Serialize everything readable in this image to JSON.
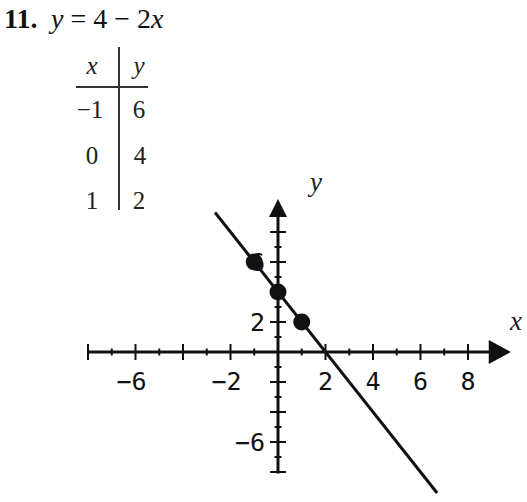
{
  "problem": {
    "number": "11.",
    "equation": {
      "lhs": "y",
      "middle": " = 4 − 2",
      "var": "x"
    }
  },
  "table": {
    "headers": [
      "x",
      "y"
    ],
    "rows": [
      [
        "−1",
        "6"
      ],
      [
        "0",
        "4"
      ],
      [
        "1",
        "2"
      ]
    ]
  },
  "chart_data": {
    "type": "line",
    "title": "y = 4 − 2x",
    "xlabel": "x",
    "ylabel": "y",
    "xlim": [
      -8,
      9.8
    ],
    "ylim": [
      -8.1,
      10.2
    ],
    "grid": false,
    "legend": null,
    "x_ticks": [
      -8,
      -7,
      -6,
      -5,
      -4,
      -3,
      -2,
      -1,
      1,
      2,
      3,
      4,
      5,
      6,
      7,
      8
    ],
    "y_ticks": [
      -8,
      -7,
      -6,
      -5,
      -4,
      -3,
      -2,
      -1,
      1,
      2,
      3,
      4,
      5,
      6,
      7,
      8
    ],
    "x_tick_labels": [
      {
        "value": -6,
        "label": "−6"
      },
      {
        "value": -2,
        "label": "−2"
      },
      {
        "value": 2,
        "label": "2"
      },
      {
        "value": 4,
        "label": "4"
      },
      {
        "value": 6,
        "label": "6"
      },
      {
        "value": 8,
        "label": "8"
      }
    ],
    "y_tick_labels": [
      {
        "value": 6,
        "label": "6"
      },
      {
        "value": 2,
        "label": "2"
      },
      {
        "value": -6,
        "label": "−6"
      }
    ],
    "series": [
      {
        "name": "y = 4 − 2x",
        "x": [
          -2.65,
          6.7
        ],
        "y": [
          9.3,
          -9.4
        ]
      }
    ],
    "points": [
      {
        "x": -1,
        "y": 6
      },
      {
        "x": 0,
        "y": 4
      },
      {
        "x": 1,
        "y": 2
      }
    ],
    "colors": {
      "ink": "#111111",
      "background": "#ffffff"
    }
  }
}
